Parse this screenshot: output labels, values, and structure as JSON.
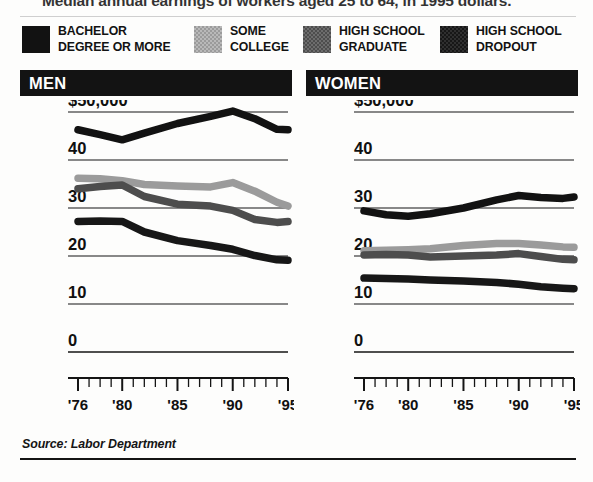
{
  "headline": "Median annual earnings of workers aged 25 to 64, in 1995 dollars.",
  "source": "Source: Labor Department",
  "legend": {
    "items": [
      {
        "label": "BACHELOR\nDEGREE OR MORE",
        "swatch": "black",
        "color": "#121212",
        "x": 0,
        "textw": 160
      },
      {
        "label": "SOME\nCOLLEGE",
        "swatch": "light",
        "color": "#9b9b9b",
        "x": 172,
        "textw": 96
      },
      {
        "label": "HIGH SCHOOL\nGRADUATE",
        "swatch": "mid",
        "color": "#4d4d4d",
        "x": 281,
        "textw": 128
      },
      {
        "label": "HIGH SCHOOL\nDROPOUT",
        "swatch": "dark",
        "color": "#171717",
        "x": 418,
        "textw": 128
      }
    ]
  },
  "panels": [
    {
      "id": "men",
      "title": "MEN"
    },
    {
      "id": "women",
      "title": "WOMEN"
    }
  ],
  "chart_data": [
    {
      "type": "line",
      "title": "MEN",
      "xlabel": "",
      "ylabel": "",
      "ylim": [
        0,
        50
      ],
      "ytick_labels": [
        "$50,000",
        "40",
        "30",
        "20",
        "10",
        "0"
      ],
      "yticks": [
        50,
        40,
        30,
        20,
        10,
        0
      ],
      "xlim": [
        1976,
        1995
      ],
      "xtick_labels": [
        "'76",
        "'80",
        "'85",
        "'90",
        "'95"
      ],
      "xticks": [
        1976,
        1980,
        1985,
        1990,
        1995
      ],
      "minor_xticks_every": 1,
      "grid": "horizontal",
      "legend_position": "top",
      "units": "thousands of 1995 dollars",
      "x": [
        1976,
        1978,
        1980,
        1982,
        1985,
        1988,
        1990,
        1992,
        1994,
        1995
      ],
      "series": [
        {
          "name": "BACHELOR DEGREE OR MORE",
          "color": "#121212",
          "values": [
            46.3,
            45.3,
            44.2,
            45.6,
            47.6,
            49.1,
            50.2,
            48.6,
            46.4,
            46.3
          ]
        },
        {
          "name": "SOME COLLEGE",
          "color": "#9b9b9b",
          "values": [
            36.2,
            36.1,
            35.7,
            34.9,
            34.6,
            34.4,
            35.3,
            33.5,
            31.2,
            30.4
          ]
        },
        {
          "name": "HIGH SCHOOL GRADUATE",
          "color": "#4d4d4d",
          "values": [
            34.0,
            34.5,
            34.8,
            32.4,
            30.8,
            30.4,
            29.5,
            27.6,
            27.0,
            27.2
          ]
        },
        {
          "name": "HIGH SCHOOL DROPOUT",
          "color": "#171717",
          "values": [
            27.2,
            27.3,
            27.2,
            25.0,
            23.2,
            22.2,
            21.4,
            20.1,
            19.2,
            19.1
          ]
        }
      ]
    },
    {
      "type": "line",
      "title": "WOMEN",
      "xlabel": "",
      "ylabel": "",
      "ylim": [
        0,
        50
      ],
      "ytick_labels": [
        "$50,000",
        "40",
        "30",
        "20",
        "10",
        "0"
      ],
      "yticks": [
        50,
        40,
        30,
        20,
        10,
        0
      ],
      "xlim": [
        1976,
        1995
      ],
      "xtick_labels": [
        "'76",
        "'80",
        "'85",
        "'90",
        "'95"
      ],
      "xticks": [
        1976,
        1980,
        1985,
        1990,
        1995
      ],
      "minor_xticks_every": 1,
      "grid": "horizontal",
      "legend_position": "top",
      "units": "thousands of 1995 dollars",
      "x": [
        1976,
        1978,
        1980,
        1982,
        1985,
        1988,
        1990,
        1992,
        1994,
        1995
      ],
      "series": [
        {
          "name": "BACHELOR DEGREE OR MORE",
          "color": "#121212",
          "values": [
            29.4,
            28.6,
            28.3,
            28.8,
            30.0,
            31.7,
            32.6,
            32.2,
            32.0,
            32.3
          ]
        },
        {
          "name": "SOME COLLEGE",
          "color": "#9b9b9b",
          "values": [
            21.1,
            21.2,
            21.3,
            21.5,
            22.2,
            22.6,
            22.6,
            22.3,
            21.9,
            21.8
          ]
        },
        {
          "name": "HIGH SCHOOL GRADUATE",
          "color": "#4d4d4d",
          "values": [
            20.2,
            20.3,
            20.2,
            19.8,
            20.0,
            20.2,
            20.5,
            19.9,
            19.3,
            19.2
          ]
        },
        {
          "name": "HIGH SCHOOL DROPOUT",
          "color": "#171717",
          "values": [
            15.4,
            15.3,
            15.2,
            15.0,
            14.8,
            14.5,
            14.1,
            13.6,
            13.3,
            13.2
          ]
        }
      ]
    }
  ]
}
